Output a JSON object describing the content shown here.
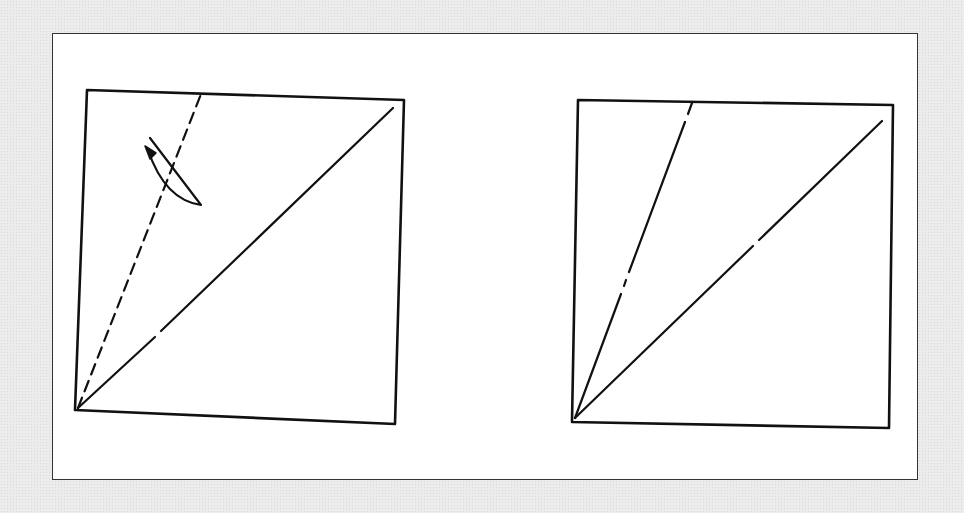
{
  "figure": {
    "colors": {
      "line": "#111111",
      "background": "#ffffff",
      "page": "#ececec"
    },
    "left_panel": {
      "square": [
        [
          87,
          90
        ],
        [
          404,
          100
        ],
        [
          395,
          424
        ],
        [
          75,
          410
        ]
      ],
      "diagonal": {
        "from": [
          78,
          408
        ],
        "to": [
          393,
          107
        ],
        "style": "solid"
      },
      "fold_line": {
        "from": [
          78,
          408
        ],
        "to": [
          201,
          93
        ],
        "style": "dashed"
      },
      "arrow": {
        "type": "curved-fold-arrow",
        "direction": "counter-clockwise"
      }
    },
    "right_panel": {
      "square": [
        [
          578,
          100
        ],
        [
          893,
          105
        ],
        [
          889,
          428
        ],
        [
          572,
          422
        ]
      ],
      "diagonal": {
        "from": [
          575,
          418
        ],
        "to": [
          882,
          120
        ],
        "style": "solid"
      },
      "crease_line": {
        "from": [
          575,
          418
        ],
        "to": [
          692,
          102
        ],
        "style": "dash-dot"
      }
    }
  }
}
